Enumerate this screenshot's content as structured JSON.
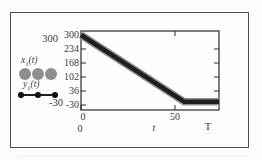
{
  "figure": {
    "left_panel": {
      "top_value": "300",
      "bottom_value": "-30",
      "legend": [
        {
          "base": "x",
          "sub": "1",
          "args": "(t)",
          "marker": "gray-circles",
          "marker_color": "#8e8e8e"
        },
        {
          "base": "y",
          "sub": "1",
          "args": "(t)",
          "marker": "black-dots",
          "marker_color": "#1f1f1f"
        }
      ]
    }
  },
  "chart_data": {
    "type": "line",
    "title": "",
    "xlabel": "t",
    "xlim": [
      0,
      73.4
    ],
    "ylim": [
      -30,
      300
    ],
    "yticks": [
      300,
      234,
      168,
      102,
      36,
      -30
    ],
    "xticks": [
      0,
      50
    ],
    "bottom_row": {
      "start": "0",
      "var": "t",
      "end": "T"
    },
    "grid": false,
    "legend_position": "outside-left",
    "box": true,
    "series": [
      {
        "name": "x1(t)",
        "marker": "large-gray-circles",
        "color": "#8e8e8e",
        "x": [
          0,
          55,
          73.4
        ],
        "y": [
          300,
          -15,
          -15
        ]
      },
      {
        "name": "y1(t)",
        "marker": "small-black-dots",
        "color": "#1f1f1f",
        "x": [
          0,
          55,
          73.4
        ],
        "y": [
          300,
          -15,
          -15
        ]
      }
    ]
  }
}
